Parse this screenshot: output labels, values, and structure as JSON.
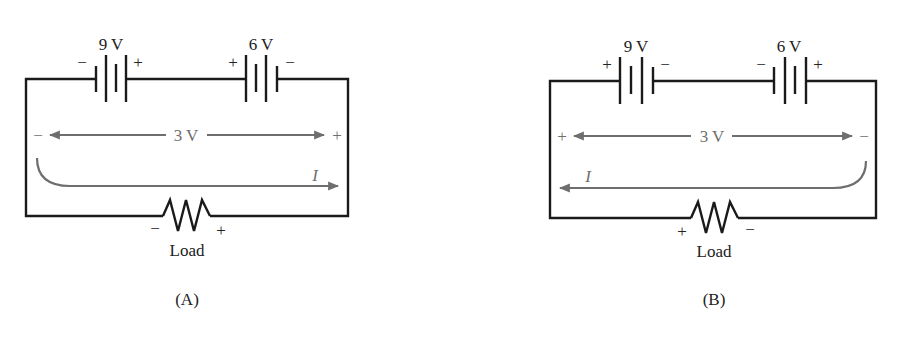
{
  "diagrams": [
    {
      "id": "A",
      "caption": "(A)",
      "battery_left": {
        "label": "9 V",
        "left_sign": "−",
        "right_sign": "+"
      },
      "battery_right": {
        "label": "6 V",
        "left_sign": "+",
        "right_sign": "−"
      },
      "net_voltage": {
        "label": "3 V",
        "left_sign": "−",
        "right_sign": "+"
      },
      "current": {
        "label": "I",
        "direction": "right"
      },
      "load": {
        "label": "Load",
        "left_sign": "−",
        "right_sign": "+"
      }
    },
    {
      "id": "B",
      "caption": "(B)",
      "battery_left": {
        "label": "9 V",
        "left_sign": "+",
        "right_sign": "−"
      },
      "battery_right": {
        "label": "6 V",
        "left_sign": "−",
        "right_sign": "+"
      },
      "net_voltage": {
        "label": "3 V",
        "left_sign": "+",
        "right_sign": "−"
      },
      "current": {
        "label": "I",
        "direction": "left"
      },
      "load": {
        "label": "Load",
        "left_sign": "+",
        "right_sign": "−"
      }
    }
  ],
  "colors": {
    "wire": "#1a1a1a",
    "annotation": "#6e6e6e"
  }
}
